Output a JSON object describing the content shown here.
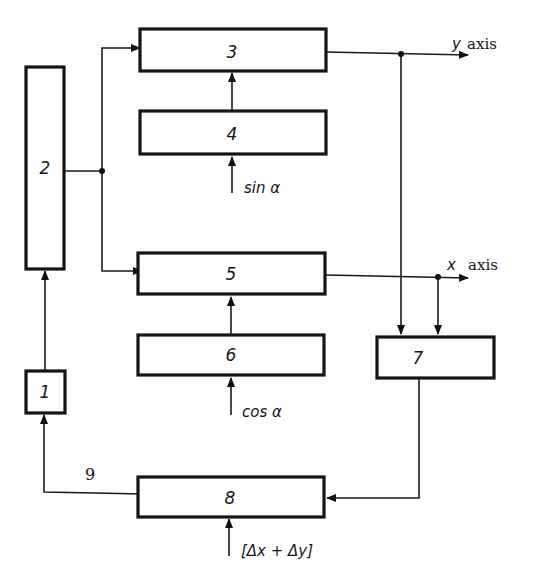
{
  "blocks": [
    {
      "id": "1",
      "label": "1"
    },
    {
      "id": "2",
      "label": "2"
    },
    {
      "id": "3",
      "label": "3"
    },
    {
      "id": "4",
      "label": "4"
    },
    {
      "id": "5",
      "label": "5"
    },
    {
      "id": "6",
      "label": "6"
    },
    {
      "id": "7",
      "label": "7"
    },
    {
      "id": "8",
      "label": "8"
    }
  ],
  "inputs": {
    "block4": "sin α",
    "block6": "cos α",
    "block8": "[Δx + Δy]"
  },
  "outputs": {
    "y_axis_var": "y",
    "y_axis_word": "axis",
    "x_axis_var": "x",
    "x_axis_word": "axis"
  },
  "feedback_label": "9",
  "colors": {
    "ink": "#141414",
    "background": "#ffffff"
  }
}
